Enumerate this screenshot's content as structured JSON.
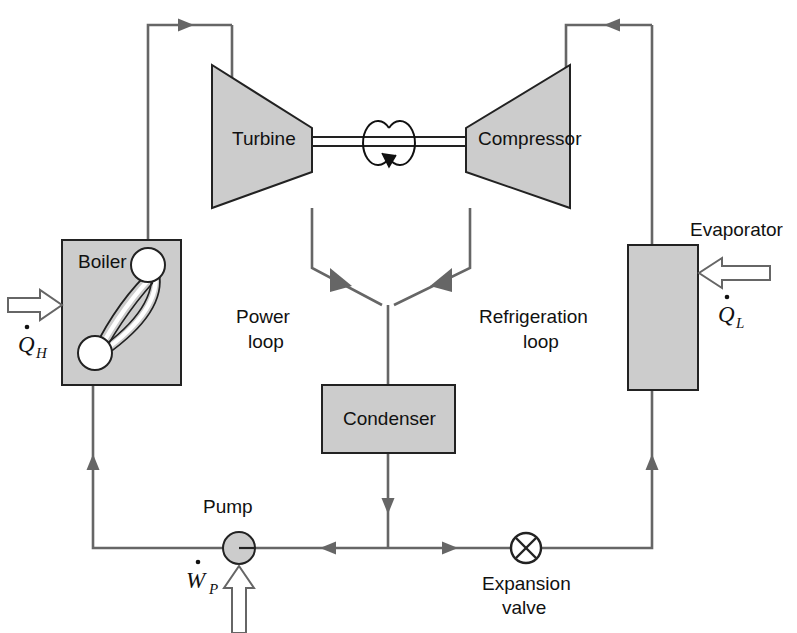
{
  "diagram": {
    "components": {
      "turbine": {
        "label": "Turbine"
      },
      "compressor": {
        "label": "Compressor"
      },
      "boiler": {
        "label": "Boiler"
      },
      "condenser": {
        "label": "Condenser"
      },
      "evaporator": {
        "label": "Evaporator"
      },
      "pump": {
        "label": "Pump"
      },
      "expansion_valve": {
        "label_line1": "Expansion",
        "label_line2": "valve"
      }
    },
    "loops": {
      "power": {
        "line1": "Power",
        "line2": "loop"
      },
      "refrigeration": {
        "line1": "Refrigeration",
        "line2": "loop"
      }
    },
    "energy_flows": {
      "heat_in_boiler": {
        "symbol": "Q",
        "subscript": "H",
        "dotted": true
      },
      "heat_in_evaporator": {
        "symbol": "Q",
        "subscript": "L",
        "dotted": true
      },
      "work_pump": {
        "symbol": "W",
        "subscript": "P",
        "dotted": true
      }
    },
    "icons": {
      "shaft": "rotating-shaft-icon",
      "valve": "expansion-valve-x-icon",
      "pump": "pump-circle-icon",
      "boiler_tubes": "boiler-tube-loop-icon",
      "heat_arrow_h": "heat-in-arrow-icon",
      "heat_arrow_l": "heat-in-arrow-icon",
      "work_arrow": "work-in-arrow-icon"
    },
    "colors": {
      "component_fill": "#cccccc",
      "line": "#666666",
      "outline": "#222222",
      "text": "#111111",
      "background": "#ffffff"
    }
  }
}
